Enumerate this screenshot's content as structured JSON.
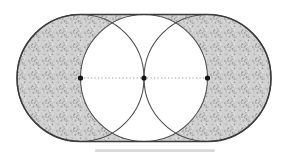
{
  "canvas": {
    "width": 285,
    "height": 152,
    "background": "#ffffff"
  },
  "diagram": {
    "type": "geometric-figure",
    "radius": 63.5,
    "axis_y": 78,
    "dot_xs": [
      80.5,
      144,
      207.5
    ],
    "dot_labels": [
      "left",
      "middle",
      "right"
    ],
    "dot_radius": 2.6,
    "dot_color": "#151515",
    "stadium": {
      "top": 14.5,
      "bottom": 141.5,
      "left": 17,
      "right": 271
    },
    "stipple": {
      "base": "#d2d2d2",
      "specks": [
        "#979797",
        "#b5b5b5",
        "#e9e9e9",
        "#8a8a8a"
      ],
      "tile": 14,
      "speck_count": 60
    },
    "strokes": {
      "outline_color": "#3b3b3b",
      "outline_width": 1.5,
      "circle_color": "#4f4f4f",
      "circle_width": 1.05,
      "dotted_color": "#8d8d8d",
      "dotted_width": 0.9,
      "dotted_dash": "1.2 2.3"
    },
    "artifact": {
      "x": 95,
      "y": 149.3,
      "width": 120,
      "height": 2.6,
      "color": "#b9b9b9",
      "opacity": 0.55
    }
  }
}
